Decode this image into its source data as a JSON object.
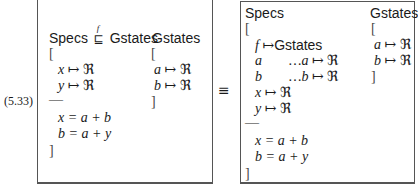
{
  "equation_number": "(5.33)",
  "equivalence_symbol": "≡",
  "left_schema": {
    "header": {
      "specs": "Specs",
      "refines_symbol": "⊑",
      "refines_label": "f",
      "gstates": "Gstates"
    },
    "gstates_label": "Gstates",
    "open_bracket": "[",
    "close_bracket": "]",
    "declarations": [
      {
        "var": "x",
        "map": "↦",
        "type": "ℜ"
      },
      {
        "var": "y",
        "map": "↦",
        "type": "ℜ"
      }
    ],
    "separator": "—",
    "predicates": [
      {
        "text": "x = a + b"
      },
      {
        "text": "b = a + y"
      }
    ],
    "gstates_block": {
      "open_bracket": "[",
      "close_bracket": "]",
      "declarations": [
        {
          "var": "a",
          "map": "↦",
          "type": "ℜ"
        },
        {
          "var": "b",
          "map": "↦",
          "type": "ℜ"
        }
      ]
    }
  },
  "right_schema": {
    "specs": "Specs",
    "gstates_label": "Gstates",
    "open_bracket": "[",
    "close_bracket": "]",
    "declarations": [
      {
        "var": "f",
        "map": "↦",
        "type": "Gstates"
      },
      {
        "var": "a",
        "path": "…a",
        "map": "↦",
        "type": "ℜ"
      },
      {
        "var": "b",
        "path": "…b",
        "map": "↦",
        "type": "ℜ"
      },
      {
        "var": "x",
        "map": "↦",
        "type": "ℜ"
      },
      {
        "var": "y",
        "map": "↦",
        "type": "ℜ"
      }
    ],
    "separator": "—",
    "predicates": [
      {
        "text": "x = a + b"
      },
      {
        "text": "b = a + y"
      }
    ],
    "gstates_block": {
      "open_bracket": "[",
      "close_bracket": "]",
      "declarations": [
        {
          "var": "a",
          "map": "↦",
          "type": "ℜ"
        },
        {
          "var": "b",
          "map": "↦",
          "type": "ℜ"
        }
      ]
    }
  }
}
